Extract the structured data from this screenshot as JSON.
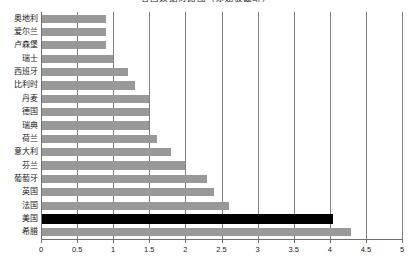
{
  "chart_data": {
    "type": "bar",
    "orientation": "horizontal",
    "title": "各国数据对比图（标题被截断）",
    "xlabel": "",
    "ylabel": "",
    "xlim": [
      0,
      5
    ],
    "xticks": [
      "0",
      "0.5",
      "1",
      "1.5",
      "2",
      "2.5",
      "3",
      "3.5",
      "4",
      "4.5",
      "5"
    ],
    "xtick_values": [
      0,
      0.5,
      1,
      1.5,
      2,
      2.5,
      3,
      3.5,
      4,
      4.5,
      5
    ],
    "grid": true,
    "grid_axis": "x",
    "legend": false,
    "categories": [
      "奥地利",
      "爱尔兰",
      "卢森堡",
      "瑞士",
      "西班牙",
      "比利时",
      "丹麦",
      "德国",
      "瑞典",
      "荷兰",
      "意大利",
      "芬兰",
      "葡萄牙",
      "英国",
      "法国",
      "美国",
      "希腊"
    ],
    "values": [
      0.9,
      0.9,
      0.9,
      1.0,
      1.2,
      1.3,
      1.5,
      1.5,
      1.5,
      1.6,
      1.8,
      2.0,
      2.3,
      2.4,
      2.6,
      4.05,
      4.3
    ],
    "bar_colors": [
      "#999999",
      "#999999",
      "#999999",
      "#999999",
      "#999999",
      "#999999",
      "#999999",
      "#999999",
      "#999999",
      "#999999",
      "#999999",
      "#999999",
      "#999999",
      "#999999",
      "#999999",
      "#000000",
      "#999999"
    ],
    "highlight_category": "美国",
    "colors": {
      "bar": "#999999",
      "highlight_bar": "#000000",
      "gridline": "#808080",
      "axis": "#6e6e6e",
      "text": "#1a1a1a",
      "background": "#ffffff"
    }
  }
}
